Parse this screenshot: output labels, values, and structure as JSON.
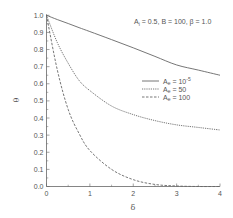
{
  "chart_data": {
    "type": "line",
    "title": "",
    "annotation": "A_i = 0.5, B = 100, β = 1.0",
    "xlabel": "δ",
    "ylabel": "θ",
    "xlim": [
      0,
      4
    ],
    "ylim": [
      0,
      1.0
    ],
    "xticks": [
      "0",
      "1",
      "2",
      "3",
      "4"
    ],
    "yticks": [
      "0.0",
      "0.1",
      "0.2",
      "0.3",
      "0.4",
      "0.5",
      "0.6",
      "0.7",
      "0.8",
      "0.9",
      "1.0"
    ],
    "grid": false,
    "legend_position": "center-right",
    "x": [
      0,
      0.25,
      0.5,
      0.75,
      1,
      1.5,
      2,
      2.5,
      3,
      3.5,
      4
    ],
    "series": [
      {
        "name": "A_e = 10^-5",
        "style": "solid",
        "values": [
          1.0,
          0.975,
          0.952,
          0.928,
          0.905,
          0.858,
          0.81,
          0.76,
          0.71,
          0.68,
          0.65
        ]
      },
      {
        "name": "A_e = 50",
        "style": "dotted",
        "values": [
          1.0,
          0.84,
          0.72,
          0.62,
          0.56,
          0.47,
          0.42,
          0.385,
          0.36,
          0.345,
          0.33
        ]
      },
      {
        "name": "A_e = 100",
        "style": "dashed",
        "values": [
          1.0,
          0.68,
          0.45,
          0.31,
          0.21,
          0.1,
          0.04,
          0.012,
          0.003,
          0.0,
          0.0
        ]
      }
    ]
  },
  "annotation_parts": {
    "a": "A",
    "a_sub": "i",
    "rest": " = 0.5, B = 100, β = 1.0"
  },
  "legend": [
    {
      "label_main": "A",
      "label_sub": "e",
      "label_rest": " = 10",
      "label_sup": "-5"
    },
    {
      "label_main": "A",
      "label_sub": "e",
      "label_rest": " = 50",
      "label_sup": ""
    },
    {
      "label_main": "A",
      "label_sub": "e",
      "label_rest": " = 100",
      "label_sup": ""
    }
  ],
  "axes": {
    "xlabel": "δ",
    "ylabel": "θ"
  },
  "colors": {
    "line": "#666666",
    "axis": "#666666",
    "text": "#555555"
  }
}
